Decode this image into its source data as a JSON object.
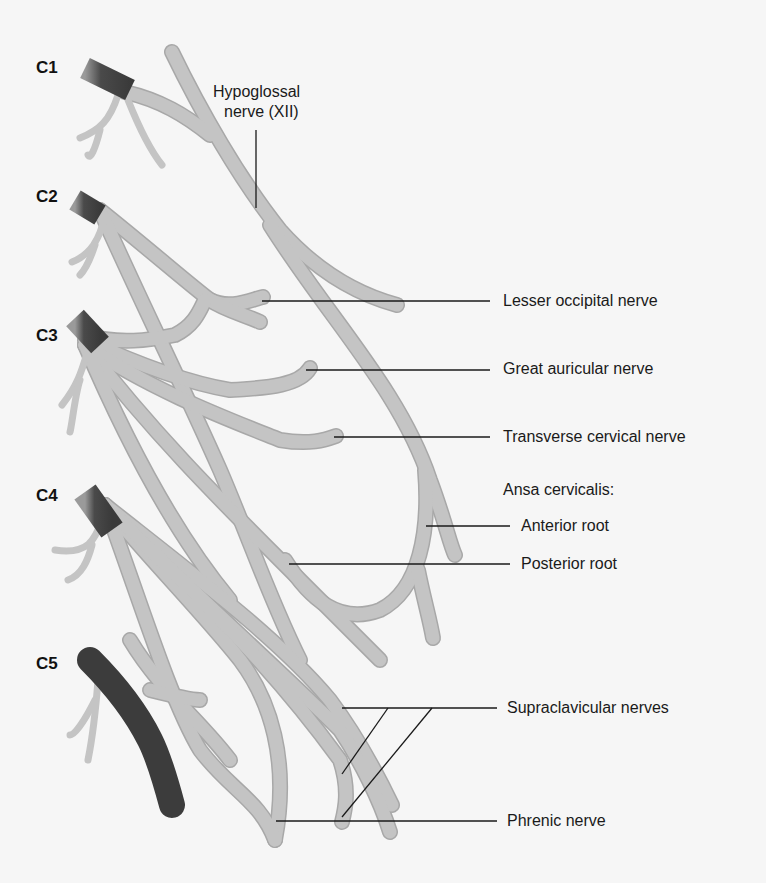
{
  "figure": {
    "segments": [
      {
        "id": "c1",
        "label": "C1"
      },
      {
        "id": "c2",
        "label": "C2"
      },
      {
        "id": "c3",
        "label": "C3"
      },
      {
        "id": "c4",
        "label": "C4"
      },
      {
        "id": "c5",
        "label": "C5"
      }
    ],
    "labels": {
      "hypoglossal_line1": "Hypoglossal",
      "hypoglossal_line2": "nerve (XII)",
      "lesser_occipital": "Lesser occipital nerve",
      "great_auricular": "Great auricular nerve",
      "transverse_cervical": "Transverse cervical nerve",
      "ansa_cervicalis": "Ansa cervicalis:",
      "anterior_root": "Anterior root",
      "posterior_root": "Posterior root",
      "supraclavicular": "Supraclavicular nerves",
      "phrenic": "Phrenic nerve"
    },
    "colors": {
      "background": "#f6f6f6",
      "nerve": "#c4c4c4",
      "root_dark": "#4a4a4a",
      "text": "#1a1a1a"
    }
  }
}
